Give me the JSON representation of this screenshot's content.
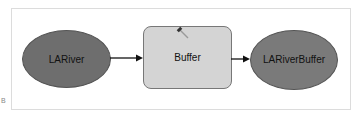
{
  "diagram": {
    "nodes": [
      {
        "id": "input",
        "label": "LARiver",
        "shape": "ellipse",
        "fill": "#6e6e6e"
      },
      {
        "id": "tool",
        "label": "Buffer",
        "shape": "rounded-rect",
        "fill": "#d4d4d4",
        "icon": "hammer-icon"
      },
      {
        "id": "output",
        "label": "LARiverBuffer",
        "display_label": "LARiverBuffe r",
        "shape": "ellipse",
        "fill": "#7a7a7a"
      }
    ],
    "edges": [
      {
        "from": "input",
        "to": "tool"
      },
      {
        "from": "tool",
        "to": "output"
      }
    ]
  },
  "margin_mark": "B"
}
